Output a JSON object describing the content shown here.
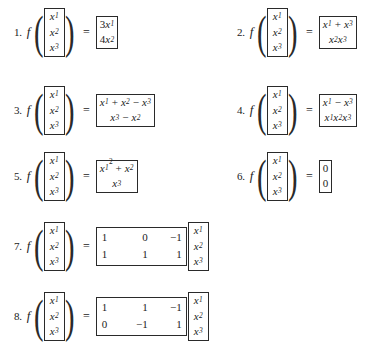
{
  "document": {
    "type": "math-exercise-list",
    "columns": 2,
    "argument_vector": [
      "x1",
      "x2",
      "x3"
    ],
    "function_symbol": "f",
    "equals_symbol": "="
  },
  "variables": {
    "x": "x",
    "sub1": "1",
    "sub2": "2",
    "sub3": "3",
    "exp2": "2"
  },
  "exercises": [
    {
      "number": "1.",
      "form": "components",
      "output_rows": [
        "3x1",
        "4x2"
      ]
    },
    {
      "number": "2.",
      "form": "components",
      "output_rows": [
        "x1 + x3",
        "x2x3"
      ]
    },
    {
      "number": "3.",
      "form": "components",
      "output_rows": [
        "x1 + x2 - x3",
        "x3 - x2"
      ]
    },
    {
      "number": "4.",
      "form": "components",
      "output_rows": [
        "x1 - x3",
        "x1x2x3"
      ]
    },
    {
      "number": "5.",
      "form": "components",
      "output_rows": [
        "x1^2 + x2",
        "x3"
      ]
    },
    {
      "number": "6.",
      "form": "components",
      "output_rows": [
        "0",
        "0"
      ]
    },
    {
      "number": "7.",
      "form": "matrix-product",
      "matrix": [
        [
          "1",
          "0",
          "-1"
        ],
        [
          "1",
          "1",
          "1"
        ]
      ],
      "multiplied_vector": [
        "x1",
        "x2",
        "x3"
      ]
    },
    {
      "number": "8.",
      "form": "matrix-product",
      "matrix": [
        [
          "1",
          "1",
          "-1"
        ],
        [
          "0",
          "-1",
          "1"
        ]
      ],
      "multiplied_vector": [
        "x1",
        "x2",
        "x3"
      ]
    }
  ],
  "numbers": {
    "n1_r1_coef": "3",
    "n1_r2_coef": "4",
    "zero": "0",
    "m7": {
      "r0c0": "1",
      "r0c1": "0",
      "r0c2": "−1",
      "r1c0": "1",
      "r1c1": "1",
      "r1c2": "1"
    },
    "m8": {
      "r0c0": "1",
      "r0c1": "1",
      "r0c2": "−1",
      "r1c0": "0",
      "r1c1": "−1",
      "r1c2": "1"
    }
  },
  "operators": {
    "plus": "+",
    "minus": "−"
  },
  "labels": {
    "item1": "1.",
    "item2": "2.",
    "item3": "3.",
    "item4": "4.",
    "item5": "5.",
    "item6": "6.",
    "item7": "7.",
    "item8": "8."
  },
  "colors": {
    "background": "#ffffff",
    "ink": "#1b1b1b",
    "rule": "#2a2a2a"
  }
}
